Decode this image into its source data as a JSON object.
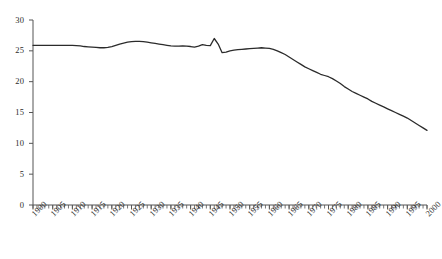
{
  "chart_data": {
    "type": "line",
    "title": "",
    "subtitle": "",
    "xlabel": "",
    "ylabel": "",
    "xlim": [
      1900,
      2000
    ],
    "ylim": [
      0,
      30
    ],
    "grid": false,
    "legend": null,
    "legend_position": "none",
    "annotations": [],
    "yticks": [
      0,
      5,
      10,
      15,
      20,
      25,
      30
    ],
    "ytick_labels": [
      "0",
      "5",
      "10",
      "15",
      "20",
      "25",
      "30"
    ],
    "xticks": [
      1900,
      1905,
      1910,
      1915,
      1920,
      1925,
      1930,
      1935,
      1940,
      1945,
      1950,
      1955,
      1960,
      1965,
      1970,
      1975,
      1980,
      1985,
      1990,
      1995,
      2000
    ],
    "xtick_labels": [
      "1900",
      "1905",
      "1910",
      "1915",
      "1920",
      "1925",
      "1930",
      "1935",
      "1940",
      "1945",
      "1950",
      "1955",
      "1960",
      "1965",
      "1970",
      "1975",
      "1980",
      "1985",
      "1990",
      "1995",
      "2000"
    ],
    "x_minor_tick_interval": 1,
    "line_color": "#2b2b2b",
    "line_width": 1.3,
    "x": [
      1900,
      1901,
      1902,
      1903,
      1904,
      1905,
      1906,
      1907,
      1908,
      1909,
      1910,
      1911,
      1912,
      1913,
      1914,
      1915,
      1916,
      1917,
      1918,
      1919,
      1920,
      1921,
      1922,
      1923,
      1924,
      1925,
      1926,
      1927,
      1928,
      1929,
      1930,
      1931,
      1932,
      1933,
      1934,
      1935,
      1936,
      1937,
      1938,
      1939,
      1940,
      1941,
      1942,
      1943,
      1944,
      1945,
      1946,
      1947,
      1948,
      1949,
      1950,
      1951,
      1952,
      1953,
      1954,
      1955,
      1956,
      1957,
      1958,
      1959,
      1960,
      1961,
      1962,
      1963,
      1964,
      1965,
      1966,
      1967,
      1968,
      1969,
      1970,
      1971,
      1972,
      1973,
      1974,
      1975,
      1976,
      1977,
      1978,
      1979,
      1980,
      1981,
      1982,
      1983,
      1984,
      1985,
      1986,
      1987,
      1988,
      1989,
      1990,
      1991,
      1992,
      1993,
      1994,
      1995,
      1996,
      1997,
      1998,
      1999,
      2000
    ],
    "y": [
      25.9,
      25.9,
      25.9,
      25.9,
      25.9,
      25.9,
      25.9,
      25.9,
      25.9,
      25.9,
      25.9,
      25.85,
      25.8,
      25.7,
      25.65,
      25.6,
      25.55,
      25.5,
      25.5,
      25.55,
      25.7,
      25.9,
      26.1,
      26.25,
      26.4,
      26.5,
      26.55,
      26.55,
      26.5,
      26.4,
      26.3,
      26.2,
      26.1,
      26.0,
      25.9,
      25.8,
      25.75,
      25.75,
      25.8,
      25.75,
      25.7,
      25.6,
      25.75,
      26.0,
      25.9,
      25.85,
      27.0,
      26.1,
      24.7,
      24.8,
      25.0,
      25.1,
      25.2,
      25.25,
      25.3,
      25.35,
      25.4,
      25.45,
      25.5,
      25.45,
      25.4,
      25.25,
      25.0,
      24.7,
      24.4,
      24.0,
      23.6,
      23.2,
      22.8,
      22.4,
      22.1,
      21.8,
      21.5,
      21.2,
      21.0,
      20.8,
      20.5,
      20.1,
      19.7,
      19.2,
      18.8,
      18.4,
      18.1,
      17.8,
      17.5,
      17.2,
      16.8,
      16.5,
      16.2,
      15.9,
      15.6,
      15.3,
      15.0,
      14.7,
      14.4,
      14.1,
      13.7,
      13.3,
      12.9,
      12.5,
      12.1
    ],
    "series": [
      {
        "name": "series-1",
        "values": [
          25.9,
          25.9,
          25.9,
          25.9,
          25.9,
          25.9,
          25.9,
          25.9,
          25.9,
          25.9,
          25.9,
          25.85,
          25.8,
          25.7,
          25.65,
          25.6,
          25.55,
          25.5,
          25.5,
          25.55,
          25.7,
          25.9,
          26.1,
          26.25,
          26.4,
          26.5,
          26.55,
          26.55,
          26.5,
          26.4,
          26.3,
          26.2,
          26.1,
          26.0,
          25.9,
          25.8,
          25.75,
          25.75,
          25.8,
          25.75,
          25.7,
          25.6,
          25.75,
          26.0,
          25.9,
          25.85,
          27.0,
          26.1,
          24.7,
          24.8,
          25.0,
          25.1,
          25.2,
          25.25,
          25.3,
          25.35,
          25.4,
          25.45,
          25.5,
          25.45,
          25.4,
          25.25,
          25.0,
          24.7,
          24.4,
          24.0,
          23.6,
          23.2,
          22.8,
          22.4,
          22.1,
          21.8,
          21.5,
          21.2,
          21.0,
          20.8,
          20.5,
          20.1,
          19.7,
          19.2,
          18.8,
          18.4,
          18.1,
          17.8,
          17.5,
          17.2,
          16.8,
          16.5,
          16.2,
          15.9,
          15.6,
          15.3,
          15.0,
          14.7,
          14.4,
          14.1,
          13.7,
          13.3,
          12.9,
          12.5,
          12.1
        ]
      }
    ]
  }
}
